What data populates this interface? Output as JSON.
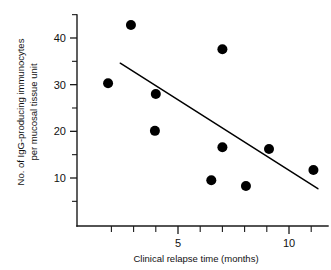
{
  "chart_data": {
    "type": "scatter",
    "title": "",
    "xlabel": "Clinical relapse time (months)",
    "ylabel": "No. of IgG-producing immunocytes per mucosal tissue unit",
    "ylabel_lines": [
      "No. of IgG-producing immunocytes",
      "per mucosal tissue unit"
    ],
    "xlim": [
      0.8,
      12.2
    ],
    "ylim": [
      2.0,
      46.5
    ],
    "grid": false,
    "legend": null,
    "x_ticks_labeled": [
      5,
      10
    ],
    "x_tick_labels": [
      "5",
      "10"
    ],
    "x_ticks_all": [
      2,
      3,
      4,
      5,
      6,
      7,
      8,
      9,
      10,
      11
    ],
    "y_ticks_labeled": [
      10,
      20,
      30,
      40
    ],
    "y_tick_labels": [
      "10",
      "20",
      "30",
      "40"
    ],
    "y_ticks_minor": [
      5,
      15,
      25,
      35,
      45
    ],
    "points": [
      {
        "x": 1.85,
        "y": 30.3
      },
      {
        "x": 2.88,
        "y": 42.8
      },
      {
        "x": 3.96,
        "y": 20.1
      },
      {
        "x": 4.0,
        "y": 28.0
      },
      {
        "x": 6.5,
        "y": 9.5
      },
      {
        "x": 7.0,
        "y": 37.6
      },
      {
        "x": 7.0,
        "y": 16.6
      },
      {
        "x": 8.06,
        "y": 8.3
      },
      {
        "x": 9.1,
        "y": 16.2
      },
      {
        "x": 11.1,
        "y": 11.7
      }
    ],
    "point_marker": "filled-circle",
    "point_color": "#000000",
    "point_radius_px": 5.0,
    "trend_line": {
      "x_start": 2.4,
      "y_start": 34.6,
      "x_end": 11.3,
      "y_end": 7.7,
      "color": "#000000"
    },
    "axis_color": "#1a1a1a",
    "background": "#ffffff"
  }
}
